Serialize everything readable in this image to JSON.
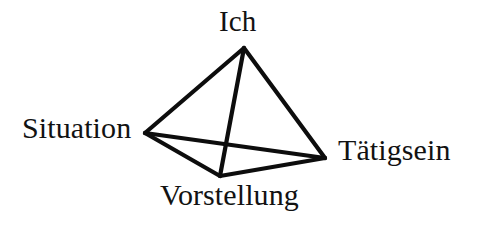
{
  "figure": {
    "shape": "tetrahedron",
    "background_color": "#ffffff",
    "line_color": "#0d0d0d",
    "text_color": "#121212",
    "line_width_px": 4.2
  },
  "vertices": [
    {
      "id": "ich",
      "label": "Ich",
      "x": 244,
      "y": 48,
      "label_position": "above"
    },
    {
      "id": "situation",
      "label": "Situation",
      "x": 145,
      "y": 133,
      "label_position": "left"
    },
    {
      "id": "taetigsein",
      "label": "Tätigsein",
      "x": 325,
      "y": 158,
      "label_position": "right"
    },
    {
      "id": "vorstellung",
      "label": "Vorstellung",
      "x": 220,
      "y": 176,
      "label_position": "below"
    }
  ],
  "edges": [
    {
      "id": "edge-ich-situation",
      "from": "ich",
      "to": "situation",
      "style": "solid"
    },
    {
      "id": "edge-ich-taetigsein",
      "from": "ich",
      "to": "taetigsein",
      "style": "solid"
    },
    {
      "id": "edge-ich-vorstellung",
      "from": "ich",
      "to": "vorstellung",
      "style": "solid"
    },
    {
      "id": "edge-situation-taetigsein",
      "from": "situation",
      "to": "taetigsein",
      "style": "solid"
    },
    {
      "id": "edge-situation-vorstellung",
      "from": "situation",
      "to": "vorstellung",
      "style": "solid"
    },
    {
      "id": "edge-vorstellung-taetigsein",
      "from": "vorstellung",
      "to": "taetigsein",
      "style": "solid"
    }
  ]
}
